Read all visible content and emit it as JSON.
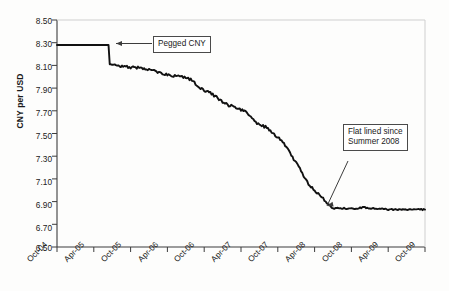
{
  "chart_data": {
    "type": "line",
    "title": "",
    "subtitle": "",
    "xlabel": "",
    "ylabel": "CNY per USD",
    "ylim": [
      6.5,
      8.5
    ],
    "ytick_step": 0.2,
    "yticks": [
      "8.50",
      "8.30",
      "8.10",
      "7.90",
      "7.70",
      "7.50",
      "7.30",
      "7.10",
      "6.90",
      "6.70",
      "6.50"
    ],
    "ytick_values": [
      8.5,
      8.3,
      8.1,
      7.9,
      7.7,
      7.5,
      7.3,
      7.1,
      6.9,
      6.7,
      6.5
    ],
    "categories": [
      "Oct-04",
      "Apr-05",
      "Oct-05",
      "Apr-06",
      "Oct-06",
      "Apr-07",
      "Oct-07",
      "Apr-08",
      "Oct-08",
      "Apr-09",
      "Oct-09"
    ],
    "xticks": [
      "Oct-04",
      "Apr-05",
      "Oct-05",
      "Apr-06",
      "Oct-06",
      "Apr-07",
      "Oct-07",
      "Apr-08",
      "Oct-08",
      "Apr-09",
      "Oct-09"
    ],
    "xlim": [
      "Oct-04",
      "Oct-09"
    ],
    "grid": false,
    "legend": "none",
    "series": [
      {
        "name": "CNY per USD",
        "color": "#111111",
        "x": [
          "Oct-04",
          "Nov-04",
          "Dec-04",
          "Jan-05",
          "Feb-05",
          "Mar-05",
          "Apr-05",
          "May-05",
          "Jun-05",
          "Jul-05",
          "Aug-05",
          "Sep-05",
          "Oct-05",
          "Nov-05",
          "Dec-05",
          "Jan-06",
          "Feb-06",
          "Mar-06",
          "Apr-06",
          "May-06",
          "Jun-06",
          "Jul-06",
          "Aug-06",
          "Sep-06",
          "Oct-06",
          "Nov-06",
          "Dec-06",
          "Jan-07",
          "Feb-07",
          "Mar-07",
          "Apr-07",
          "May-07",
          "Jun-07",
          "Jul-07",
          "Aug-07",
          "Sep-07",
          "Oct-07",
          "Nov-07",
          "Dec-07",
          "Jan-08",
          "Feb-08",
          "Mar-08",
          "Apr-08",
          "May-08",
          "Jun-08",
          "Jul-08",
          "Aug-08",
          "Sep-08",
          "Oct-08",
          "Nov-08",
          "Dec-08",
          "Jan-09",
          "Feb-09",
          "Mar-09",
          "Apr-09",
          "May-09",
          "Jun-09",
          "Jul-09",
          "Aug-09",
          "Sep-09",
          "Oct-09"
        ],
        "values": [
          8.28,
          8.28,
          8.28,
          8.28,
          8.28,
          8.28,
          8.28,
          8.28,
          8.28,
          8.11,
          8.1,
          8.09,
          8.08,
          8.08,
          8.07,
          8.06,
          8.05,
          8.03,
          8.02,
          8.01,
          8.0,
          7.99,
          7.97,
          7.92,
          7.88,
          7.86,
          7.82,
          7.78,
          7.75,
          7.73,
          7.71,
          7.68,
          7.63,
          7.57,
          7.56,
          7.51,
          7.47,
          7.41,
          7.33,
          7.24,
          7.15,
          7.06,
          6.99,
          6.95,
          6.89,
          6.84,
          6.84,
          6.84,
          6.84,
          6.84,
          6.85,
          6.84,
          6.84,
          6.84,
          6.83,
          6.83,
          6.83,
          6.83,
          6.83,
          6.83,
          6.83
        ]
      }
    ],
    "annotations": [
      {
        "id": "pegged-cny",
        "text": "Pegged CNY",
        "box_x_pct": 33.0,
        "box_y_value": 8.33,
        "arrow_to_x": "Jun-05",
        "arrow_to_value": 8.28,
        "arrow_style": "horizontal-left"
      },
      {
        "id": "flat-lined",
        "line1": "Flat lined since",
        "line2": "Summer 2008",
        "box_x_pct": 75.0,
        "box_y_value": 7.57,
        "arrow_to_x": "Aug-08",
        "arrow_to_value": 6.88,
        "arrow_style": "diagonal-down-left"
      }
    ]
  },
  "axes": {
    "y_title": "CNY per USD"
  }
}
